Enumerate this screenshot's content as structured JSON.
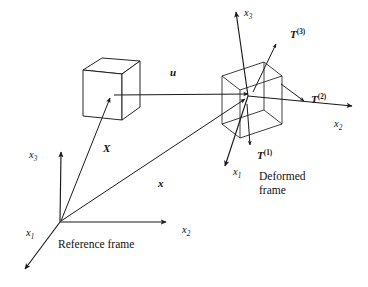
{
  "figure": {
    "background_color": "#ffffff",
    "line_color": "#1a1a1a"
  },
  "reference_frame": {
    "caption": "Reference frame",
    "origin": {
      "x": 60,
      "y": 222
    },
    "axes": [
      {
        "name": "x1",
        "base": "x",
        "subscript": "1",
        "label_x": 26,
        "label_y": 236,
        "tip_x": 22,
        "tip_y": 272
      },
      {
        "name": "x2",
        "base": "x",
        "subscript": "2",
        "label_x": 182,
        "label_y": 233,
        "tip_x": 170,
        "tip_y": 222
      },
      {
        "name": "x3",
        "base": "x",
        "subscript": "3",
        "label_x": 29,
        "label_y": 158,
        "tip_x": 61,
        "tip_y": 148
      }
    ],
    "cube": {
      "center_x": 112,
      "center_y": 95,
      "style": "opaque"
    }
  },
  "deformed_frame": {
    "caption_line1": "Deformed",
    "caption_line2": "frame",
    "origin": {
      "x": 248,
      "y": 96
    },
    "axes": [
      {
        "name": "x1",
        "base": "x",
        "subscript": "1",
        "label_x": 233,
        "label_y": 175,
        "tip_x": 222,
        "tip_y": 170
      },
      {
        "name": "x2",
        "base": "x",
        "subscript": "2",
        "label_x": 334,
        "label_y": 127,
        "tip_x": 356,
        "tip_y": 106
      },
      {
        "name": "x3",
        "base": "x",
        "subscript": "3",
        "label_x": 244,
        "label_y": 16,
        "tip_x": 235,
        "tip_y": 8
      }
    ],
    "cube": {
      "center_x": 250,
      "center_y": 97,
      "style": "wireframe"
    }
  },
  "vectors": [
    {
      "name": "X",
      "label": "X",
      "label_x": 103,
      "label_y": 152,
      "from_x": 61,
      "from_y": 221,
      "to_x": 110,
      "to_y": 97,
      "description": "material position vector to reference configuration"
    },
    {
      "name": "x",
      "label": "x",
      "label_x": 158,
      "label_y": 187,
      "from_x": 61,
      "from_y": 221,
      "to_x": 247,
      "to_y": 98,
      "description": "spatial position vector to deformed configuration"
    },
    {
      "name": "u",
      "label": "u",
      "label_x": 170,
      "label_y": 76,
      "from_x": 114,
      "from_y": 95,
      "to_x": 250,
      "to_y": 95,
      "description": "displacement vector"
    }
  ],
  "tractions": [
    {
      "name": "T1",
      "base": "T",
      "superscript": "(1)",
      "label_x": 257,
      "label_y": 159,
      "from_x": 247,
      "from_y": 103,
      "to_x": 250,
      "to_y": 148,
      "description": "traction vector on face with normal x1"
    },
    {
      "name": "T2",
      "base": "T",
      "superscript": "(2)",
      "label_x": 311,
      "label_y": 103,
      "from_x": 281,
      "from_y": 84,
      "to_x": 306,
      "to_y": 102,
      "description": "traction vector on face with normal x2"
    },
    {
      "name": "T3",
      "base": "T",
      "superscript": "(3)",
      "label_x": 290,
      "label_y": 38,
      "from_x": 253,
      "from_y": 92,
      "to_x": 277,
      "to_y": 42,
      "description": "traction vector on face with normal x3"
    }
  ]
}
